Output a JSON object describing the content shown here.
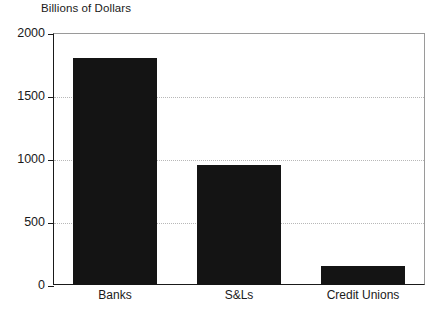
{
  "chart_data": {
    "type": "bar",
    "title": "Billions of Dollars",
    "xlabel": "",
    "ylabel": "",
    "categories": [
      "Banks",
      "S&Ls",
      "Credit Unions"
    ],
    "values": [
      1800,
      950,
      150
    ],
    "series": [
      {
        "name": "Assets",
        "values": [
          1800,
          950,
          150
        ]
      }
    ],
    "ylim": [
      0,
      2000
    ],
    "yticks": [
      0,
      500,
      1000,
      1500,
      2000
    ],
    "ytick_labels": [
      "0",
      "500",
      "1000",
      "1500",
      "2000"
    ],
    "grid": "horizontal-dotted",
    "legend": "none",
    "bar_color": "#141414",
    "grid_color": "#b8b8b8",
    "axis_color": "#1a1a1a"
  }
}
